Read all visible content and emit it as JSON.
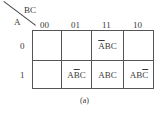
{
  "kmap": {
    "row_var": "A",
    "col_var": "BC",
    "col_headers": [
      "00",
      "01",
      "11",
      "10"
    ],
    "row_headers": [
      "0",
      "1"
    ],
    "cells": {
      "r0c2": {
        "pre": "",
        "bar": "A",
        "post": "BC"
      },
      "r1c1": {
        "pre": "A",
        "bar": "B",
        "post": "C"
      },
      "r1c2": {
        "pre": "ABC",
        "bar": "",
        "post": ""
      },
      "r1c3": {
        "pre": "AB",
        "bar": "C",
        "post": ""
      }
    },
    "caption": "(a)"
  }
}
